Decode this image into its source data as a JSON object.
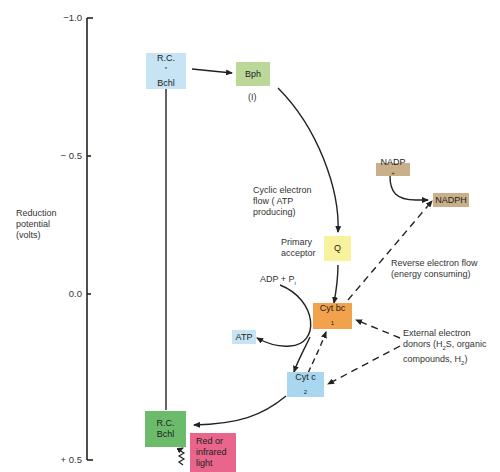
{
  "axis": {
    "label_line1": "Reduction",
    "label_line2": "potential",
    "label_line3": "(volts)",
    "ticks": [
      {
        "label": "−1.0",
        "value": -1.0
      },
      {
        "label": "− 0.5",
        "value": -0.5
      },
      {
        "label": "0.0",
        "value": 0.0
      },
      {
        "label": "+ 0.5",
        "value": 0.5
      }
    ]
  },
  "nodes": {
    "rc_excited": {
      "line1": "R.C.",
      "sup": "*",
      "line2": "Bchl",
      "color": "#c6e4f3"
    },
    "bph": {
      "label": "Bph",
      "sublabel": "(I)",
      "color": "#bcd898"
    },
    "q": {
      "label": "Q",
      "color": "#f8f29c"
    },
    "cyt_bc1": {
      "label": "Cyt bc",
      "sub": "1",
      "color": "#f2a24d"
    },
    "cyt_c2": {
      "label": "Cyt c",
      "sub": "2",
      "color": "#a9d7f0"
    },
    "rc_ground": {
      "line1": "R.C.",
      "line2": "Bchl",
      "color": "#6bbb6b"
    },
    "light": {
      "line1": "Red or",
      "line2": "infrared",
      "line3": "light",
      "color": "#e9658c"
    },
    "atp": {
      "label": "ATP",
      "color": "#c6e4f3"
    },
    "nadp": {
      "label": "NADP",
      "sup": "+",
      "color": "#c9b08a"
    },
    "nadph": {
      "label": "NADPH",
      "color": "#c9b08a"
    }
  },
  "annotations": {
    "cyclic_line1": "Cyclic electron",
    "cyclic_line2": "flow ( ATP",
    "cyclic_line3": "producing)",
    "primary_line1": "Primary",
    "primary_line2": "acceptor",
    "adp": "ADP + P",
    "adp_sub": "i",
    "reverse_line1": "Reverse electron flow",
    "reverse_line2": "(energy consuming)",
    "external_line1": "External electron",
    "external_line2_a": "donors (H",
    "external_line2_sub": "2",
    "external_line2_b": "S, organic",
    "external_line3_a": "compounds, H",
    "external_line3_sub": "2",
    "external_line3_b": ")"
  }
}
